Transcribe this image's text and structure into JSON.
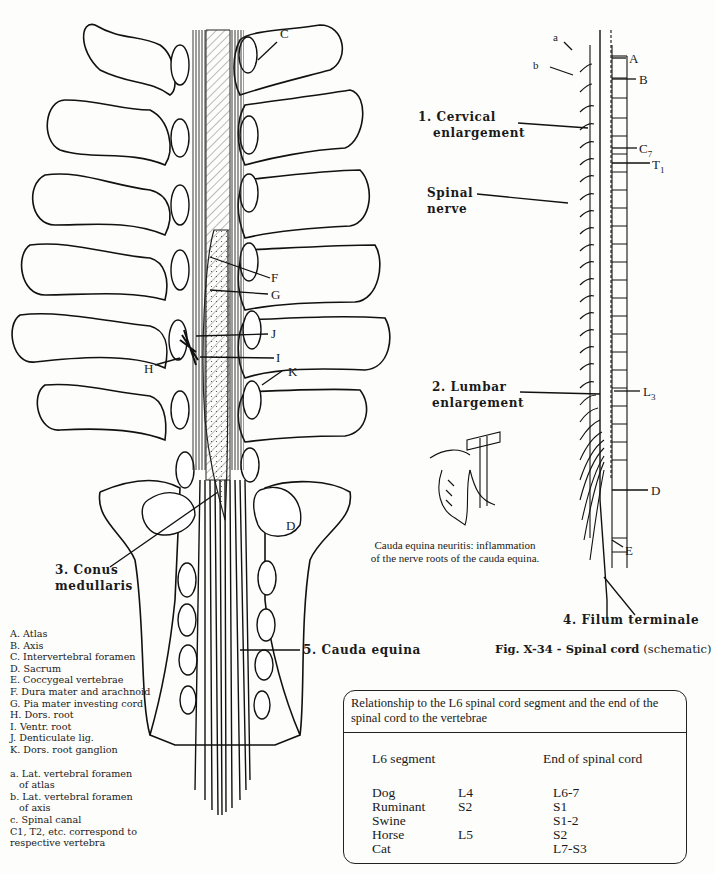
{
  "figure": {
    "number": "Fig. X-34",
    "title_bold": "Fig. X-34 - Spinal cord",
    "title_normal": "(schematic)"
  },
  "left_diagram": {
    "letter_labels": [
      "C",
      "F",
      "G",
      "J",
      "I",
      "H",
      "K",
      "D"
    ],
    "numbered_labels": {
      "conus_line1": "3. Conus",
      "conus_line2": "medullaris",
      "cauda": "5. Cauda equina"
    }
  },
  "right_diagram": {
    "top_labels": {
      "a": "a",
      "b": "b",
      "A": "A",
      "B": "B",
      "C7_main": "C",
      "C7_sub": "7",
      "T1_main": "T",
      "T1_sub": "1",
      "L3_main": "L",
      "L3_sub": "3",
      "D": "D",
      "E": "E"
    },
    "numbered_labels": {
      "cervical_line1": "1. Cervical",
      "cervical_line2": "enlargement",
      "spinal_line1": "Spinal",
      "spinal_line2": "nerve",
      "lumbar_line1": "2. Lumbar",
      "lumbar_line2": "enlargement",
      "filum": "4. Filum terminale"
    }
  },
  "inset": {
    "caption_line1": "Cauda equina neuritis: inflammation",
    "caption_line2": "of the nerve roots of the cauda equina."
  },
  "legend": {
    "items": [
      "A. Atlas",
      "B. Axis",
      "C. Intervertebral foramen",
      "D. Sacrum",
      "E. Coccygeal vertebrae",
      "F. Dura mater and arachnoid",
      "G. Pia mater investing cord",
      "H. Dors. root",
      "I. Ventr. root",
      "J. Denticulate lig.",
      "K. Dors. root ganglion"
    ],
    "lower_items": [
      {
        "line1": "a. Lat. vertebral foramen",
        "line2": "of atlas"
      },
      {
        "line1": "b. Lat. vertebral foramen",
        "line2": "of axis"
      },
      {
        "line1": "c. Spinal canal"
      },
      {
        "line1": "C1, T2, etc. correspond to",
        "line2": "respective vertebra"
      }
    ]
  },
  "table": {
    "header": "Relationship to the L6 spinal cord segment and the end of the spinal cord to the vertebrae",
    "col1": "L6 segment",
    "col2": "End of spinal cord",
    "rows": [
      {
        "species": "Dog",
        "l6": "L4",
        "end": "L6-7"
      },
      {
        "species": "Ruminant",
        "l6": "S2",
        "end": "S1"
      },
      {
        "species": "Swine",
        "l6": "",
        "end": "S1-2"
      },
      {
        "species": "Horse",
        "l6": "L5",
        "end": "S2"
      },
      {
        "species": "Cat",
        "l6": "",
        "end": "L7-S3"
      }
    ]
  }
}
